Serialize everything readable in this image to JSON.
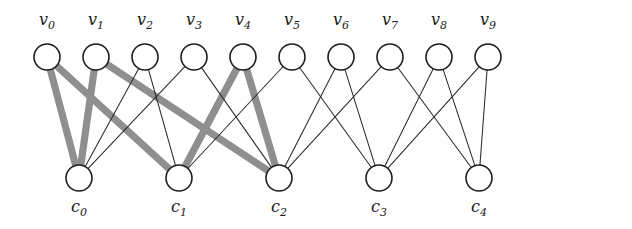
{
  "figure": {
    "width": 632,
    "height": 229,
    "background": "#ffffff"
  },
  "style": {
    "node_fill": "#ffffff",
    "node_stroke": "#1d1d1d",
    "node_radius": 13,
    "edge_color": "#2b2b2b",
    "edge_width": 1.05,
    "highlight_color": "#8f8f8f",
    "highlight_width": 7.2,
    "label_color": "#1a1a1a"
  },
  "variable_nodes": [
    {
      "id": "v0",
      "base": "v",
      "sub": "0",
      "x": 47,
      "y": 57,
      "label_x": 47,
      "label_y": 25
    },
    {
      "id": "v1",
      "base": "v",
      "sub": "1",
      "x": 96,
      "y": 57,
      "label_x": 96,
      "label_y": 25
    },
    {
      "id": "v2",
      "base": "v",
      "sub": "2",
      "x": 145,
      "y": 57,
      "label_x": 145,
      "label_y": 25
    },
    {
      "id": "v3",
      "base": "v",
      "sub": "3",
      "x": 194,
      "y": 57,
      "label_x": 194,
      "label_y": 25
    },
    {
      "id": "v4",
      "base": "v",
      "sub": "4",
      "x": 243,
      "y": 57,
      "label_x": 243,
      "label_y": 25
    },
    {
      "id": "v5",
      "base": "v",
      "sub": "5",
      "x": 292,
      "y": 57,
      "label_x": 292,
      "label_y": 25
    },
    {
      "id": "v6",
      "base": "v",
      "sub": "6",
      "x": 341,
      "y": 57,
      "label_x": 341,
      "label_y": 25
    },
    {
      "id": "v7",
      "base": "v",
      "sub": "7",
      "x": 390,
      "y": 57,
      "label_x": 390,
      "label_y": 25
    },
    {
      "id": "v8",
      "base": "v",
      "sub": "8",
      "x": 439,
      "y": 57,
      "label_x": 439,
      "label_y": 25
    },
    {
      "id": "v9",
      "base": "v",
      "sub": "9",
      "x": 488,
      "y": 57,
      "label_x": 488,
      "label_y": 25
    }
  ],
  "check_nodes": [
    {
      "id": "c0",
      "base": "c",
      "sub": "0",
      "x": 79,
      "y": 178,
      "label_x": 79,
      "label_y": 212
    },
    {
      "id": "c1",
      "base": "c",
      "sub": "1",
      "x": 179,
      "y": 178,
      "label_x": 179,
      "label_y": 212
    },
    {
      "id": "c2",
      "base": "c",
      "sub": "2",
      "x": 279,
      "y": 178,
      "label_x": 279,
      "label_y": 212
    },
    {
      "id": "c3",
      "base": "c",
      "sub": "3",
      "x": 379,
      "y": 178,
      "label_x": 379,
      "label_y": 212
    },
    {
      "id": "c4",
      "base": "c",
      "sub": "4",
      "x": 479,
      "y": 178,
      "label_x": 479,
      "label_y": 212
    }
  ],
  "edges": [
    {
      "from": "v0",
      "to": "c0",
      "highlight": true
    },
    {
      "from": "v0",
      "to": "c1",
      "highlight": true
    },
    {
      "from": "v1",
      "to": "c0",
      "highlight": true
    },
    {
      "from": "v1",
      "to": "c2",
      "highlight": true
    },
    {
      "from": "v2",
      "to": "c0",
      "highlight": false
    },
    {
      "from": "v2",
      "to": "c1",
      "highlight": false
    },
    {
      "from": "v3",
      "to": "c0",
      "highlight": false
    },
    {
      "from": "v3",
      "to": "c2",
      "highlight": false
    },
    {
      "from": "v4",
      "to": "c1",
      "highlight": true
    },
    {
      "from": "v4",
      "to": "c2",
      "highlight": true
    },
    {
      "from": "v5",
      "to": "c1",
      "highlight": false
    },
    {
      "from": "v5",
      "to": "c3",
      "highlight": false
    },
    {
      "from": "v6",
      "to": "c2",
      "highlight": false
    },
    {
      "from": "v6",
      "to": "c3",
      "highlight": false
    },
    {
      "from": "v7",
      "to": "c2",
      "highlight": false
    },
    {
      "from": "v7",
      "to": "c4",
      "highlight": false
    },
    {
      "from": "v8",
      "to": "c3",
      "highlight": false
    },
    {
      "from": "v8",
      "to": "c4",
      "highlight": false
    },
    {
      "from": "v9",
      "to": "c3",
      "highlight": false
    },
    {
      "from": "v9",
      "to": "c4",
      "highlight": false
    }
  ],
  "graph_data": {
    "type": "bipartite-tanner-graph",
    "variable_node_degree": 2,
    "check_node_degree": 4,
    "variable_node_count": 10,
    "check_node_count": 5,
    "edge_count": 20,
    "highlighted_cycle": [
      "v0",
      "c0",
      "v1",
      "c2",
      "v4",
      "c1",
      "v0"
    ],
    "highlighted_cycle_length": 6,
    "adjacency": {
      "c0": [
        "v0",
        "v1",
        "v2",
        "v3"
      ],
      "c1": [
        "v0",
        "v2",
        "v4",
        "v5"
      ],
      "c2": [
        "v1",
        "v3",
        "v4",
        "v6"
      ],
      "c3": [
        "v5",
        "v6",
        "v8",
        "v9"
      ],
      "c4": [
        "v7",
        "v8",
        "v9"
      ]
    }
  }
}
